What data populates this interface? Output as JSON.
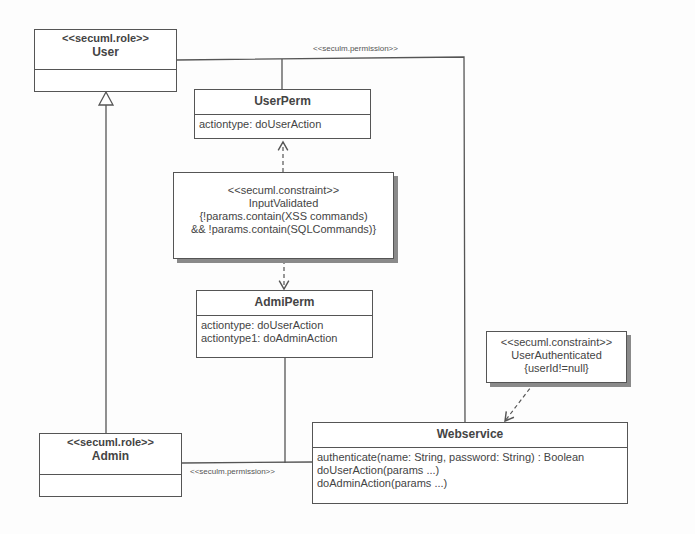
{
  "classes": {
    "user": {
      "stereotype": "<<secuml.role>>",
      "name": "User"
    },
    "admin": {
      "stereotype": "<<secuml.role>>",
      "name": "Admin"
    },
    "userperm": {
      "name": "UserPerm",
      "attributes": [
        "actiontype: doUserAction"
      ]
    },
    "admiperm": {
      "name": "AdmiPerm",
      "attributes": [
        "actiontype: doUserAction",
        "actiontype1: doAdminAction"
      ]
    },
    "webservice": {
      "name": "Webservice",
      "operations": [
        "authenticate(name: String, password: String) : Boolean",
        "doUserAction(params ...)",
        "doAdminAction(params ...)"
      ]
    }
  },
  "constraints": {
    "input_validated": {
      "stereotype": "<<secuml.constraint>>",
      "name": "InputValidated",
      "lines": [
        "{!params.contain(XSS commands)",
        "&& !params.contain(SQLCommands)}"
      ]
    },
    "user_authenticated": {
      "stereotype": "<<secuml.constraint>>",
      "name": "UserAuthenticated",
      "lines": [
        "{userId!=null}"
      ]
    }
  },
  "associations": {
    "top_label": "<<seculm.permission>>",
    "bottom_label": "<<seculm.permission>>"
  },
  "colors": {
    "line": "#555555",
    "shadow": "#8a8a8a",
    "text": "#444444"
  }
}
